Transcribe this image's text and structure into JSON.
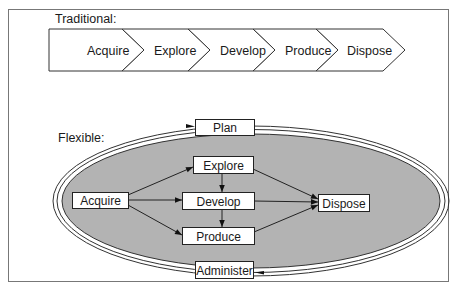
{
  "traditional": {
    "label": "Traditional:",
    "stages": [
      "Acquire",
      "Explore",
      "Develop",
      "Produce",
      "Dispose"
    ]
  },
  "flexible": {
    "label": "Flexible:",
    "nodes": {
      "plan": "Plan",
      "explore": "Explore",
      "develop": "Develop",
      "produce": "Produce",
      "acquire": "Acquire",
      "dispose": "Dispose",
      "administer": "Administer"
    }
  },
  "colors": {
    "ellipse_fill": "#b3b3b3",
    "stroke": "#222222",
    "frame": "#555555",
    "background": "#ffffff"
  }
}
